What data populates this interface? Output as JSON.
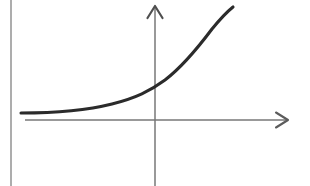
{
  "figure": {
    "description": "Hand-drawn style line graph of an increasing, upward-concave curve crossing a pair of arrowed axes",
    "background_color": "#ffffff",
    "width": 310,
    "height": 186
  },
  "page_rule": {
    "name": "page-border-line",
    "color": "#8a8a8a",
    "x": 11,
    "y_start": 0,
    "y_end": 186,
    "stroke_width": 1.4
  },
  "axes": {
    "color": "#777777",
    "stroke_width": 1.5,
    "origin": {
      "x": 155,
      "y": 120
    },
    "x_axis": {
      "label": "x-axis",
      "x_start": 25,
      "x_end": 288,
      "y": 120,
      "arrow": "right"
    },
    "y_axis": {
      "label": "y-axis",
      "x": 155,
      "y_start": 186,
      "y_end": 6,
      "arrow": "up"
    }
  },
  "curve": {
    "label": "exponential curve",
    "color": "#2b2b2b",
    "stroke_width": 3.1,
    "equation_hint": "y = a·b^x (exponential growth)",
    "start_point": {
      "x": 21,
      "y": 113
    },
    "y_intercept_point": {
      "x": 155,
      "y": 86
    },
    "end_point": {
      "x": 233,
      "y": 7
    },
    "path": "M 21 113 C 52 113, 88 110, 112 104 C 136 98, 150 91, 165 80 C 182 67, 200 45, 212 29 C 221 18, 228 11, 233 7"
  },
  "chart_data": {
    "type": "line",
    "title": "",
    "xlabel": "",
    "ylabel": "",
    "grid": false,
    "legend": "none",
    "xlim": [
      -134,
      133
    ],
    "ylim": [
      -66,
      114
    ],
    "series": [
      {
        "name": "exponential curve",
        "color": "#2b2b2b",
        "x": [
          -134,
          -100,
          -70,
          -43,
          -20,
          0,
          10,
          30,
          45,
          57,
          66,
          74,
          78
        ],
        "y": [
          7,
          10,
          13,
          17,
          24,
          34,
          41,
          57,
          75,
          91,
          102,
          109,
          113
        ]
      }
    ],
    "annotations": [
      {
        "name": "x-axis-arrow",
        "text": "",
        "position": "right"
      },
      {
        "name": "y-axis-arrow",
        "text": "",
        "position": "top"
      }
    ]
  }
}
